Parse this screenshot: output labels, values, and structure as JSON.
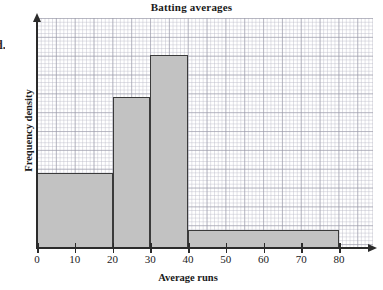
{
  "chart_data": {
    "type": "bar",
    "title": "Batting averages",
    "xlabel": "Average runs",
    "ylabel": "Frequency density",
    "grid": true,
    "legend": "none",
    "xlim": [
      0,
      89
    ],
    "ylim": [
      0,
      1.0
    ],
    "xticks": [
      0,
      10,
      20,
      30,
      40,
      50,
      60,
      70,
      80
    ],
    "xticklabels": [
      "0",
      "10",
      "20",
      "30",
      "40",
      "50",
      "60",
      "70",
      "80"
    ],
    "yticks": [],
    "yticklabels": [],
    "bins": [
      {
        "label": "0-20",
        "x_start": 0,
        "x_end": 20,
        "frequency_density": 0.326
      },
      {
        "label": "20-30",
        "x_start": 20,
        "x_end": 30,
        "frequency_density": 0.657
      },
      {
        "label": "30-40",
        "x_start": 30,
        "x_end": 40,
        "frequency_density": 0.839
      },
      {
        "label": "40-80",
        "x_start": 40,
        "x_end": 80,
        "frequency_density": 0.078
      }
    ],
    "bar_fill_color": "#c2c2c2",
    "bar_edge_color": "#3a3a3a",
    "grid_color": "#b9b9c6",
    "grid_major_color": "#9696a5",
    "axis_color": "#2b2b2b"
  },
  "margin": {
    "cut_off_text": "d."
  }
}
